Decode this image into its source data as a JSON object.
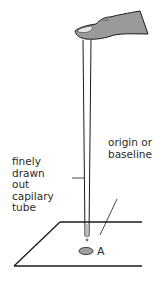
{
  "figure": {
    "type": "labeled-diagram",
    "labels": {
      "capillary": "finely drawn\nout capilary\ntube",
      "origin": "origin or\nbaseline",
      "spot": "A"
    },
    "colors": {
      "line": "#1a1a1a",
      "finger_fill": "#9a9a9a",
      "nail_fill": "#e8e8e8",
      "spot_fill": "#a0a0a0",
      "background": "#ffffff"
    }
  }
}
